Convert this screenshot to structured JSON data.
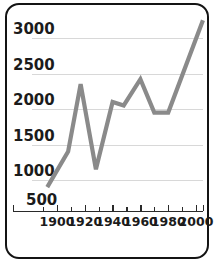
{
  "chart_data": {
    "type": "line",
    "title": "",
    "subtitle": "",
    "xlabel": "",
    "ylabel": "",
    "xlim": [
      1890,
      2008
    ],
    "ylim": [
      500,
      3300
    ],
    "grid": true,
    "legend": null,
    "legend_position": "none",
    "line_color": "#8a8a8a",
    "axis_color": "#2a2a2a",
    "grid_color": "#d8d8d8",
    "y_ticks": [
      500,
      1000,
      1500,
      2000,
      2500,
      3000
    ],
    "y_tick_labels": [
      "500",
      "1000",
      "1500",
      "2000",
      "2500",
      "3000"
    ],
    "y_gridline_values": [
      1000,
      1500,
      2000,
      2500,
      3000
    ],
    "x_ticks": [
      1900,
      1920,
      1940,
      1960,
      1980,
      2000
    ],
    "x_tick_labels": [
      "1900",
      "1920",
      "1940",
      "1960",
      "1980",
      "2000"
    ],
    "x_minor_ticks": [
      1890,
      1910,
      1930,
      1950,
      1970,
      1990
    ],
    "x": [
      1893,
      1908,
      1917,
      1928,
      1940,
      1948,
      1960,
      1970,
      1980,
      2005
    ],
    "values": [
      900,
      1400,
      2350,
      1150,
      2100,
      2050,
      2420,
      1950,
      1950,
      3250
    ],
    "points": [
      {
        "x": 1893,
        "y": 900
      },
      {
        "x": 1908,
        "y": 1400
      },
      {
        "x": 1917,
        "y": 2350
      },
      {
        "x": 1928,
        "y": 1150
      },
      {
        "x": 1940,
        "y": 2100
      },
      {
        "x": 1948,
        "y": 2050
      },
      {
        "x": 1960,
        "y": 2420
      },
      {
        "x": 1970,
        "y": 1950
      },
      {
        "x": 1980,
        "y": 1950
      },
      {
        "x": 2005,
        "y": 3250
      }
    ]
  },
  "axes": {
    "y_labels": [
      "3000",
      "2500",
      "2000",
      "1500",
      "1000",
      "500"
    ],
    "x_labels": [
      "1900",
      "1920",
      "1940",
      "1960",
      "1980",
      "2000"
    ]
  }
}
